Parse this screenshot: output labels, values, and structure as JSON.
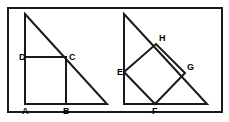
{
  "figure": {
    "canvas": {
      "width": 229,
      "height": 122
    },
    "colors": {
      "stroke": "#1a1a1a",
      "background": "#ffffff",
      "label": "#000000",
      "border": "#1a1a1a"
    },
    "border": {
      "name": "outer-frame",
      "x": 8,
      "y": 8,
      "width": 214,
      "height": 104,
      "stroke_width": 2
    },
    "left_figure": {
      "name": "triangle-with-axis-aligned-square",
      "triangle": {
        "apex": {
          "x": 25,
          "y": 14
        },
        "bottom_left": {
          "x": 25,
          "y": 104
        },
        "bottom_right": {
          "x": 107,
          "y": 104
        }
      },
      "square": {
        "A": {
          "x": 25,
          "y": 104
        },
        "B": {
          "x": 66,
          "y": 104
        },
        "C": {
          "x": 66,
          "y": 57
        },
        "D": {
          "x": 25,
          "y": 57
        }
      },
      "labels": [
        {
          "text": "D",
          "x": 19,
          "y": 60,
          "name": "vertex-label-d"
        },
        {
          "text": "C",
          "x": 69,
          "y": 60,
          "name": "vertex-label-c"
        },
        {
          "text": "A",
          "x": 22,
          "y": 114,
          "name": "vertex-label-a"
        },
        {
          "text": "B",
          "x": 63,
          "y": 114,
          "name": "vertex-label-b"
        }
      ]
    },
    "right_figure": {
      "name": "triangle-with-rotated-square",
      "triangle": {
        "apex": {
          "x": 124,
          "y": 14
        },
        "bottom_left": {
          "x": 124,
          "y": 104
        },
        "bottom_right": {
          "x": 207,
          "y": 104
        }
      },
      "square": {
        "E": {
          "x": 124,
          "y": 72
        },
        "H": {
          "x": 156,
          "y": 44
        },
        "G": {
          "x": 185,
          "y": 73
        },
        "F": {
          "x": 155,
          "y": 104
        }
      },
      "labels": [
        {
          "text": "H",
          "x": 159,
          "y": 41,
          "name": "vertex-label-h"
        },
        {
          "text": "E",
          "x": 117,
          "y": 75,
          "name": "vertex-label-e"
        },
        {
          "text": "G",
          "x": 187,
          "y": 70,
          "name": "vertex-label-g"
        },
        {
          "text": "F",
          "x": 152,
          "y": 114,
          "name": "vertex-label-f"
        }
      ]
    }
  }
}
